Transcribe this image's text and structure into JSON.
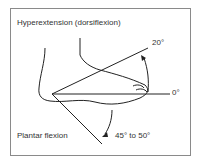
{
  "diagram": {
    "title": "Hyperextension (dorsiflexion)",
    "labels": {
      "dorsiflexion_angle": "20°",
      "neutral_angle": "0°",
      "plantar_label": "Plantar flexion",
      "plantar_angle": "45° to 50°"
    },
    "colors": {
      "line": "#222222",
      "border": "#8a8a8a",
      "text": "#333333"
    }
  }
}
